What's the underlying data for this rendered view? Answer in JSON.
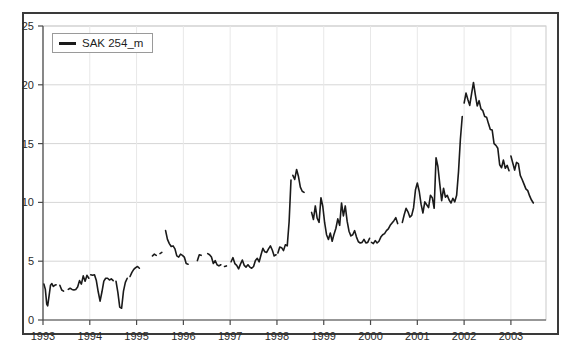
{
  "chart_data": {
    "type": "line",
    "title": "",
    "subtitle": "",
    "xlabel": "",
    "ylabel": "",
    "xlim": [
      1993.0,
      2003.75
    ],
    "ylim": [
      0,
      25
    ],
    "yticks": [
      0,
      5,
      10,
      15,
      20,
      25
    ],
    "xticks": [
      1993,
      1994,
      1995,
      1996,
      1997,
      1998,
      1999,
      2000,
      2001,
      2002,
      2003
    ],
    "xtick_labels": [
      "1993",
      "1994",
      "1995",
      "1996",
      "1997",
      "1998",
      "1999",
      "2000",
      "2001",
      "2002",
      "2003"
    ],
    "ytick_labels": [
      "0",
      "5",
      "10",
      "15",
      "20",
      "25"
    ],
    "grid": true,
    "grid_axis": "y",
    "legend": {
      "position": "top-left",
      "entries": [
        "SAK 254_m"
      ]
    },
    "line_color": "#1a1a1a",
    "line_width": 1.6,
    "series": [
      {
        "name": "SAK 254_m",
        "color": "#1a1a1a",
        "segments": [
          {
            "x": [
              1993.02,
              1993.05,
              1993.08,
              1993.1,
              1993.13,
              1993.16,
              1993.19,
              1993.22,
              1993.25,
              1993.28
            ],
            "y": [
              3.05,
              2.6,
              1.35,
              1.2,
              2.05,
              2.95,
              3.1,
              2.85,
              2.95,
              3.0
            ]
          },
          {
            "x": [
              1993.36,
              1993.4,
              1993.44
            ],
            "y": [
              2.95,
              2.55,
              2.45
            ]
          },
          {
            "x": [
              1993.54,
              1993.58,
              1993.62,
              1993.66,
              1993.7,
              1993.74,
              1993.78,
              1993.82,
              1993.86,
              1993.9,
              1993.94,
              1993.98
            ],
            "y": [
              2.6,
              2.7,
              2.6,
              2.55,
              2.6,
              2.8,
              3.35,
              3.05,
              3.75,
              3.3,
              3.8,
              3.55
            ]
          },
          {
            "x": [
              1994.02,
              1994.06,
              1994.1,
              1994.14,
              1994.18,
              1994.22,
              1994.26,
              1994.3,
              1994.34,
              1994.38,
              1994.42,
              1994.46,
              1994.5
            ],
            "y": [
              3.85,
              3.8,
              3.85,
              3.35,
              2.4,
              1.6,
              2.4,
              3.3,
              3.55,
              3.55,
              3.4,
              3.5,
              3.35
            ]
          },
          {
            "x": [
              1994.56,
              1994.6,
              1994.64,
              1994.68,
              1994.72,
              1994.76,
              1994.8
            ],
            "y": [
              3.3,
              2.35,
              1.1,
              1.0,
              2.45,
              3.2,
              3.55
            ]
          },
          {
            "x": [
              1994.86,
              1994.9,
              1994.94,
              1994.98,
              1995.02,
              1995.06
            ],
            "y": [
              3.7,
              4.05,
              4.3,
              4.45,
              4.55,
              4.4
            ]
          },
          {
            "x": [
              1995.34,
              1995.38,
              1995.42
            ],
            "y": [
              5.45,
              5.6,
              5.5
            ]
          },
          {
            "x": [
              1995.5,
              1995.54
            ],
            "y": [
              5.65,
              5.75
            ]
          },
          {
            "x": [
              1995.62,
              1995.66,
              1995.7,
              1995.74,
              1995.78,
              1995.82,
              1995.86,
              1995.9,
              1995.94,
              1995.98,
              1996.02,
              1996.06,
              1996.1
            ],
            "y": [
              7.6,
              6.85,
              6.5,
              6.25,
              6.3,
              6.05,
              5.45,
              5.35,
              5.6,
              5.5,
              5.35,
              4.8,
              4.75
            ]
          },
          {
            "x": [
              1996.3,
              1996.34,
              1996.38
            ],
            "y": [
              5.05,
              5.55,
              5.5
            ]
          },
          {
            "x": [
              1996.52,
              1996.56,
              1996.6,
              1996.64,
              1996.68,
              1996.72,
              1996.76,
              1996.8
            ],
            "y": [
              5.65,
              5.55,
              5.35,
              4.8,
              5.05,
              4.7,
              4.6,
              4.7
            ]
          },
          {
            "x": [
              1996.88,
              1996.92
            ],
            "y": [
              4.55,
              4.6
            ]
          },
          {
            "x": [
              1997.02,
              1997.06,
              1997.1,
              1997.14,
              1997.18,
              1997.22,
              1997.26,
              1997.3,
              1997.34,
              1997.38,
              1997.42,
              1997.46,
              1997.5,
              1997.54,
              1997.58,
              1997.62,
              1997.66,
              1997.7,
              1997.74,
              1997.78,
              1997.82,
              1997.86,
              1997.9,
              1997.94,
              1997.98
            ],
            "y": [
              4.95,
              5.3,
              4.8,
              4.65,
              4.35,
              4.75,
              5.1,
              4.65,
              4.5,
              4.7,
              4.5,
              4.4,
              4.55,
              5.05,
              5.25,
              4.95,
              5.55,
              6.1,
              5.8,
              5.75,
              6.05,
              6.3,
              5.95,
              5.45,
              5.55
            ]
          },
          {
            "x": [
              1998.02,
              1998.06,
              1998.1,
              1998.14,
              1998.18,
              1998.22,
              1998.26,
              1998.3
            ],
            "y": [
              5.7,
              6.2,
              6.15,
              5.9,
              6.4,
              6.3,
              8.35,
              11.9
            ]
          },
          {
            "x": [
              1998.34,
              1998.38,
              1998.42,
              1998.46,
              1998.5,
              1998.54,
              1998.58
            ],
            "y": [
              12.3,
              11.95,
              12.8,
              12.2,
              11.3,
              10.95,
              10.85
            ]
          },
          {
            "x": [
              1998.74,
              1998.78,
              1998.82,
              1998.86,
              1998.9,
              1998.94,
              1998.98,
              1999.02,
              1999.06,
              1999.1,
              1999.14,
              1999.18,
              1999.22,
              1999.26,
              1999.3,
              1999.34,
              1999.38,
              1999.42,
              1999.46,
              1999.5,
              1999.54,
              1999.58,
              1999.62,
              1999.66,
              1999.7,
              1999.74,
              1999.78,
              1999.82,
              1999.86,
              1999.9,
              1999.94,
              1999.98
            ],
            "y": [
              9.15,
              8.55,
              9.7,
              8.65,
              8.3,
              10.4,
              9.65,
              8.25,
              7.25,
              6.85,
              7.4,
              6.7,
              7.3,
              7.8,
              8.6,
              8.05,
              9.95,
              8.85,
              9.7,
              8.4,
              7.55,
              7.15,
              7.25,
              7.6,
              7.05,
              6.65,
              6.55,
              6.6,
              6.85,
              6.55,
              6.6,
              6.95
            ]
          },
          {
            "x": [
              2000.02,
              2000.06,
              2000.1,
              2000.14,
              2000.18,
              2000.22,
              2000.26,
              2000.3,
              2000.34,
              2000.38,
              2000.42,
              2000.46,
              2000.5,
              2000.54,
              2000.58
            ],
            "y": [
              6.6,
              6.5,
              6.75,
              6.55,
              6.7,
              7.05,
              7.25,
              7.35,
              7.6,
              7.75,
              8.05,
              8.25,
              8.45,
              8.7,
              8.2
            ]
          },
          {
            "x": [
              2000.68,
              2000.72,
              2000.76,
              2000.8,
              2000.84,
              2000.88,
              2000.92,
              2000.96,
              2001.0,
              2001.04,
              2001.08,
              2001.12,
              2001.16,
              2001.2,
              2001.24,
              2001.28,
              2001.32,
              2001.36,
              2001.4,
              2001.44,
              2001.48,
              2001.52,
              2001.56,
              2001.6,
              2001.64,
              2001.68,
              2001.72,
              2001.76,
              2001.8,
              2001.84,
              2001.88,
              2001.92,
              2001.96
            ],
            "y": [
              8.3,
              8.95,
              9.5,
              9.2,
              8.75,
              8.9,
              9.55,
              11.05,
              11.65,
              10.95,
              9.85,
              9.1,
              10.05,
              9.8,
              9.55,
              10.6,
              10.4,
              9.5,
              13.8,
              13.05,
              11.55,
              10.15,
              11.2,
              10.45,
              10.6,
              10.2,
              9.95,
              10.35,
              10.05,
              10.6,
              12.6,
              15.35,
              17.3
            ]
          },
          {
            "x": [
              2002.0,
              2002.04,
              2002.08,
              2002.12,
              2002.16,
              2002.2,
              2002.24,
              2002.28,
              2002.32,
              2002.36,
              2002.4,
              2002.44,
              2002.48,
              2002.52,
              2002.56,
              2002.6,
              2002.64,
              2002.68,
              2002.72,
              2002.76,
              2002.8,
              2002.84,
              2002.88,
              2002.92,
              2002.96
            ],
            "y": [
              18.45,
              19.3,
              18.75,
              18.25,
              19.25,
              20.2,
              19.15,
              18.2,
              18.65,
              17.95,
              17.8,
              17.3,
              17.25,
              16.7,
              16.2,
              16.15,
              15.0,
              14.85,
              14.6,
              13.2,
              12.95,
              13.6,
              12.9,
              13.15,
              12.7
            ]
          },
          {
            "x": [
              2003.0,
              2003.04,
              2003.08,
              2003.12,
              2003.16,
              2003.2,
              2003.24,
              2003.28,
              2003.32,
              2003.36,
              2003.4,
              2003.44,
              2003.48
            ],
            "y": [
              13.95,
              13.35,
              12.75,
              13.4,
              13.3,
              12.3,
              11.95,
              11.55,
              11.15,
              11.0,
              10.55,
              10.2,
              9.95
            ]
          }
        ]
      }
    ]
  }
}
